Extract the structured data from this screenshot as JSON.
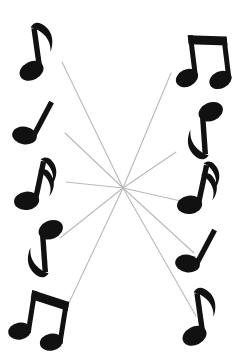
{
  "figure": {
    "title": "Radial arrangement of musical notes",
    "background_color": "#ffffff",
    "note_color": "#111111",
    "line_color": "#b9b9b9",
    "width": 240,
    "height": 360
  },
  "center": {
    "label": "convergence-point",
    "x": 123,
    "y": 188
  },
  "rays": [
    {
      "name": "ray-upper-left",
      "x1": 123,
      "y1": 188,
      "x2": 62,
      "y2": 62,
      "width": 1.1
    },
    {
      "name": "ray-left-upper-mid",
      "x1": 123,
      "y1": 188,
      "x2": 65,
      "y2": 133,
      "width": 1.1
    },
    {
      "name": "ray-left-horizontal",
      "x1": 123,
      "y1": 188,
      "x2": 66,
      "y2": 182,
      "width": 1.1
    },
    {
      "name": "ray-left-lower-mid",
      "x1": 123,
      "y1": 188,
      "x2": 60,
      "y2": 238,
      "width": 1.1
    },
    {
      "name": "ray-lower-left",
      "x1": 123,
      "y1": 188,
      "x2": 67,
      "y2": 307,
      "width": 1.1
    },
    {
      "name": "ray-upper-right",
      "x1": 123,
      "y1": 188,
      "x2": 171,
      "y2": 73,
      "width": 1.1
    },
    {
      "name": "ray-right-upper-mid",
      "x1": 123,
      "y1": 188,
      "x2": 176,
      "y2": 152,
      "width": 1.1
    },
    {
      "name": "ray-right-horizontal",
      "x1": 123,
      "y1": 188,
      "x2": 181,
      "y2": 201,
      "width": 1.1
    },
    {
      "name": "ray-right-lower-mid",
      "x1": 123,
      "y1": 188,
      "x2": 194,
      "y2": 253,
      "width": 1.1
    },
    {
      "name": "ray-lower-right",
      "x1": 123,
      "y1": 188,
      "x2": 196,
      "y2": 316,
      "width": 1.1
    }
  ],
  "notes": [
    {
      "name": "note-top-left",
      "glyph": "eighth-note",
      "label": "Eighth note",
      "x": 40,
      "y": 52,
      "rotation": -8,
      "scale": 1.0
    },
    {
      "name": "note-top-right",
      "glyph": "beamed-eighth-pair",
      "label": "Beamed pair of eighth notes",
      "x": 202,
      "y": 57,
      "rotation": -7,
      "scale": 1.0
    },
    {
      "name": "note-left-upper",
      "glyph": "quarter-note",
      "label": "Quarter note",
      "x": 42,
      "y": 125,
      "rotation": 28,
      "scale": 1.0
    },
    {
      "name": "note-right-upper",
      "glyph": "eighth-note",
      "label": "Eighth note, inverted",
      "x": 201,
      "y": 130,
      "rotation": 176,
      "scale": 1.0
    },
    {
      "name": "note-left-middle",
      "glyph": "sixteenth-note",
      "label": "Sixteenth note",
      "x": 41,
      "y": 186,
      "rotation": 12,
      "scale": 1.0
    },
    {
      "name": "note-right-middle",
      "glyph": "sixteenth-note",
      "label": "Sixteenth note",
      "x": 204,
      "y": 190,
      "rotation": 12,
      "scale": 1.0
    },
    {
      "name": "note-left-lower",
      "glyph": "eighth-note",
      "label": "Eighth note, inverted",
      "x": 41,
      "y": 248,
      "rotation": 176,
      "scale": 1.0
    },
    {
      "name": "note-right-lower",
      "glyph": "quarter-note",
      "label": "Quarter note",
      "x": 205,
      "y": 253,
      "rotation": 28,
      "scale": 1.0
    },
    {
      "name": "note-bottom-left",
      "glyph": "beamed-eighth-pair",
      "label": "Beamed pair of eighth notes",
      "x": 40,
      "y": 315,
      "rotation": 9,
      "scale": 1.0
    },
    {
      "name": "note-bottom-right",
      "glyph": "eighth-note",
      "label": "Eighth note",
      "x": 203,
      "y": 317,
      "rotation": -8,
      "scale": 1.0
    }
  ]
}
